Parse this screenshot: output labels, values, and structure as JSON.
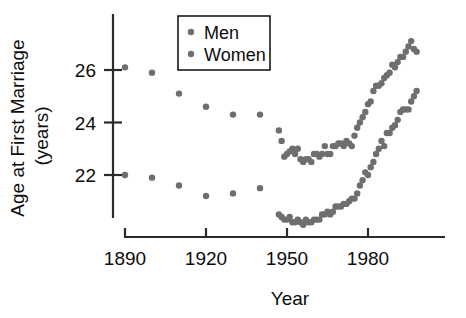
{
  "chart_data": {
    "type": "scatter",
    "title": "",
    "xlabel": "Year",
    "ylabel": "Age at First Marriage (years)",
    "ylabel_line1": "Age at First Marriage",
    "ylabel_line2": "(years)",
    "xlim": [
      1885,
      1999
    ],
    "ylim": [
      20.2,
      28.0
    ],
    "xticks": [
      1890,
      1920,
      1950,
      1980
    ],
    "xtick_labels": [
      "1890",
      "1920",
      "1950",
      "1980"
    ],
    "yticks": [
      22,
      24,
      26
    ],
    "ytick_labels": [
      "22",
      "24",
      "26"
    ],
    "grid": false,
    "legend_position": "top-center",
    "marker_color": "#6e6e6e",
    "axis_color": "#2b2b2b",
    "series": [
      {
        "name": "Men",
        "color": "#6e6e6e",
        "x": [
          1890,
          1900,
          1910,
          1920,
          1930,
          1940,
          1947,
          1948,
          1949,
          1950,
          1951,
          1952,
          1953,
          1954,
          1955,
          1956,
          1957,
          1958,
          1959,
          1960,
          1961,
          1962,
          1963,
          1964,
          1965,
          1966,
          1967,
          1968,
          1969,
          1970,
          1971,
          1972,
          1973,
          1974,
          1975,
          1976,
          1977,
          1978,
          1979,
          1980,
          1981,
          1982,
          1983,
          1984,
          1985,
          1986,
          1987,
          1988,
          1989,
          1990,
          1991,
          1992,
          1993,
          1994,
          1995,
          1996,
          1997,
          1998
        ],
        "values": [
          26.1,
          25.9,
          25.1,
          24.6,
          24.3,
          24.3,
          23.7,
          23.3,
          22.7,
          22.8,
          22.9,
          23.0,
          22.8,
          23.0,
          22.6,
          22.5,
          22.6,
          22.6,
          22.5,
          22.8,
          22.8,
          22.7,
          22.8,
          23.1,
          22.8,
          22.8,
          23.1,
          23.1,
          23.2,
          23.2,
          23.1,
          23.3,
          23.2,
          23.1,
          23.5,
          23.8,
          24.0,
          24.2,
          24.4,
          24.7,
          24.8,
          25.2,
          25.4,
          25.4,
          25.5,
          25.7,
          25.8,
          25.9,
          26.2,
          26.1,
          26.3,
          26.5,
          26.5,
          26.7,
          26.9,
          27.1,
          26.8,
          26.7
        ],
        "marker_size": 3.2
      },
      {
        "name": "Women",
        "color": "#6e6e6e",
        "x": [
          1890,
          1900,
          1910,
          1920,
          1930,
          1940,
          1947,
          1948,
          1949,
          1950,
          1951,
          1952,
          1953,
          1954,
          1955,
          1956,
          1957,
          1958,
          1959,
          1960,
          1961,
          1962,
          1963,
          1964,
          1965,
          1966,
          1967,
          1968,
          1969,
          1970,
          1971,
          1972,
          1973,
          1974,
          1975,
          1976,
          1977,
          1978,
          1979,
          1980,
          1981,
          1982,
          1983,
          1984,
          1985,
          1986,
          1987,
          1988,
          1989,
          1990,
          1991,
          1992,
          1993,
          1994,
          1995,
          1996,
          1997,
          1998
        ],
        "values": [
          22.0,
          21.9,
          21.6,
          21.2,
          21.3,
          21.5,
          20.5,
          20.4,
          20.3,
          20.3,
          20.4,
          20.2,
          20.2,
          20.3,
          20.2,
          20.1,
          20.3,
          20.2,
          20.2,
          20.3,
          20.3,
          20.3,
          20.5,
          20.5,
          20.6,
          20.5,
          20.6,
          20.8,
          20.8,
          20.8,
          20.9,
          20.9,
          21.0,
          21.1,
          21.1,
          21.3,
          21.6,
          21.8,
          22.1,
          22.0,
          22.3,
          22.5,
          22.8,
          23.0,
          23.3,
          23.1,
          23.6,
          23.6,
          23.8,
          23.9,
          24.1,
          24.4,
          24.5,
          24.5,
          24.5,
          24.8,
          25.0,
          25.2
        ],
        "marker_size": 3.2
      }
    ]
  },
  "legend": {
    "entries": [
      {
        "label": "Men"
      },
      {
        "label": "Women"
      }
    ]
  }
}
